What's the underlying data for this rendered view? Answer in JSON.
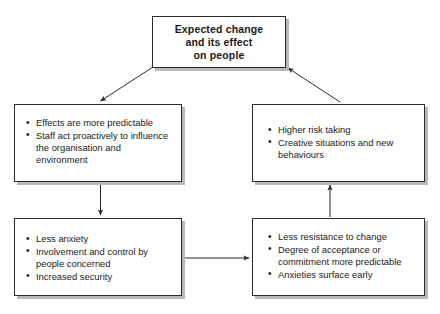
{
  "diagram": {
    "type": "cycle-flow-diagram",
    "line_color": "#2b2b2b",
    "shadow_color": "#b9b9b9",
    "background_color": "#ffffff",
    "nodes": [
      {
        "id": "expected-change",
        "title": "Expected change\nand its effect\non people",
        "title_line1": "Expected change",
        "title_line2": "and its effect",
        "title_line3": "on people",
        "bold": true
      },
      {
        "id": "effects-predictable",
        "bullets": [
          "Effects are more predictable",
          "Staff act proactively to influence the organisation and environment"
        ]
      },
      {
        "id": "higher-risk",
        "bullets": [
          "Higher risk taking",
          "Creative situations and new behaviours"
        ]
      },
      {
        "id": "less-anxiety",
        "bullets": [
          "Less anxiety",
          "Involvement and control by people concerned",
          "Increased security"
        ]
      },
      {
        "id": "less-resistance",
        "bullets": [
          "Less resistance to change",
          "Degree of acceptance or commitment more predictable",
          "Anxieties surface early"
        ]
      }
    ],
    "arrows": [
      {
        "id": "expected-change-to-effects",
        "from": "expected-change",
        "to": "effects-predictable",
        "direction": "diagonal-down-left"
      },
      {
        "id": "effects-to-less-anxiety",
        "from": "effects-predictable",
        "to": "less-anxiety",
        "direction": "down"
      },
      {
        "id": "less-anxiety-to-less-resistance",
        "from": "less-anxiety",
        "to": "less-resistance",
        "direction": "right"
      },
      {
        "id": "less-resistance-to-higher-risk",
        "from": "less-resistance",
        "to": "higher-risk",
        "direction": "up"
      },
      {
        "id": "higher-risk-to-expected-change",
        "from": "higher-risk",
        "to": "expected-change",
        "direction": "diagonal-up-left"
      }
    ]
  }
}
